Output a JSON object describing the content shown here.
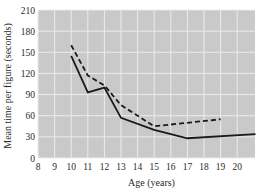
{
  "chart_data": {
    "type": "line",
    "title": "",
    "xlabel": "Age (years)",
    "ylabel": "Mean time per figure (seconds)",
    "xlim": [
      8,
      21.1
    ],
    "ylim": [
      0,
      210
    ],
    "xticks": [
      8,
      9,
      10,
      11,
      12,
      13,
      14,
      15,
      16,
      17,
      18,
      19,
      20
    ],
    "yticks": [
      0,
      30,
      60,
      90,
      120,
      150,
      180,
      210
    ],
    "grid": true,
    "legend": null,
    "series": [
      {
        "name": "solid",
        "style": "solid",
        "color": "#1a1a1a",
        "x": [
          10,
          11,
          12,
          13,
          15,
          17,
          21.1
        ],
        "y": [
          145,
          93,
          100,
          57,
          40,
          28,
          34
        ]
      },
      {
        "name": "dashed",
        "style": "dashed",
        "color": "#1a1a1a",
        "x": [
          10,
          11,
          12,
          13,
          15,
          19
        ],
        "y": [
          160,
          117,
          103,
          75,
          45,
          55
        ]
      }
    ]
  },
  "colors": {
    "plot_bg": "#c9c9c9",
    "grid": "#ececec",
    "line": "#1a1a1a"
  }
}
